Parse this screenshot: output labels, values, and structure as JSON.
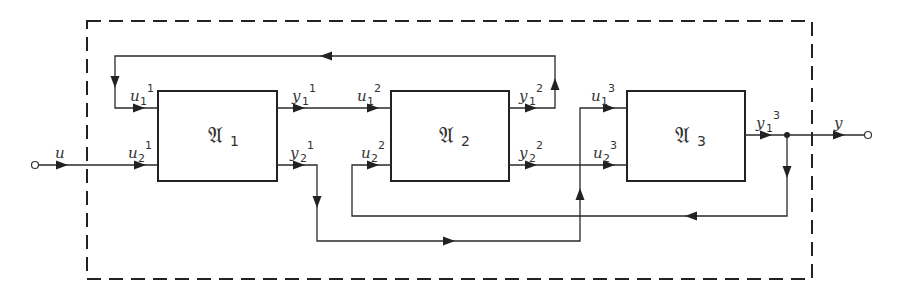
{
  "diagram": {
    "type": "block-diagram",
    "enclosure": "dashed system boundary",
    "input": {
      "label": "u"
    },
    "output": {
      "label": "y"
    },
    "blocks": [
      {
        "id": "A1",
        "symbol": "𝔄",
        "subscript": "1",
        "inputs": [
          {
            "label": "u",
            "sub": "1",
            "sup": "1"
          },
          {
            "label": "u",
            "sub": "2",
            "sup": "1"
          }
        ],
        "outputs": [
          {
            "label": "y",
            "sub": "1",
            "sup": "1"
          },
          {
            "label": "y",
            "sub": "2",
            "sup": "1"
          }
        ]
      },
      {
        "id": "A2",
        "symbol": "𝔄",
        "subscript": "2",
        "inputs": [
          {
            "label": "u",
            "sub": "1",
            "sup": "2"
          },
          {
            "label": "u",
            "sub": "2",
            "sup": "2"
          }
        ],
        "outputs": [
          {
            "label": "y",
            "sub": "1",
            "sup": "2"
          },
          {
            "label": "y",
            "sub": "2",
            "sup": "2"
          }
        ]
      },
      {
        "id": "A3",
        "symbol": "𝔄",
        "subscript": "3",
        "inputs": [
          {
            "label": "u",
            "sub": "1",
            "sup": "3"
          },
          {
            "label": "u",
            "sub": "2",
            "sup": "3"
          }
        ],
        "outputs": [
          {
            "label": "y",
            "sub": "1",
            "sup": "3"
          }
        ]
      }
    ],
    "connections": [
      {
        "from": "u",
        "to": "u2^1"
      },
      {
        "from": "y1^1",
        "to": "u1^2"
      },
      {
        "from": "y1^2",
        "to": "u1^1",
        "note": "top feedback loop"
      },
      {
        "from": "y2^1",
        "to": "u1^3",
        "note": "bottom routed path"
      },
      {
        "from": "y2^2",
        "to": "u2^3"
      },
      {
        "from": "y1^3",
        "to": "y"
      },
      {
        "from": "y1^3",
        "to": "u2^2",
        "note": "feedback via junction"
      }
    ]
  }
}
